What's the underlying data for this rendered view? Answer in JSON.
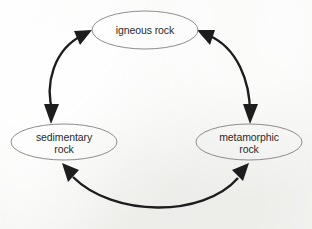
{
  "diagram": {
    "type": "cycle-diagram",
    "background_color": "#f2f2f0",
    "node_stroke_color": "#8d8d8d",
    "arrow_color": "#1d1d1d",
    "text_color": "#2b2b2b",
    "nodes": [
      {
        "id": "igneous",
        "label_line1": "igneous rock",
        "label_line2": "",
        "cx": 145,
        "cy": 30,
        "rx": 53,
        "ry": 19
      },
      {
        "id": "sedimentary",
        "label_line1": "sedimentary",
        "label_line2": "rock",
        "cx": 64,
        "cy": 142,
        "rx": 53,
        "ry": 18
      },
      {
        "id": "metamorphic",
        "label_line1": "metamorphic",
        "label_line2": "rock",
        "cx": 249,
        "cy": 142,
        "rx": 53,
        "ry": 18
      }
    ],
    "connectors": [
      {
        "id": "igneous-sedimentary",
        "from": "igneous",
        "to": "sedimentary",
        "style": "double-headed-curved-arrow",
        "bow": "outward-left"
      },
      {
        "id": "igneous-metamorphic",
        "from": "igneous",
        "to": "metamorphic",
        "style": "double-headed-curved-arrow",
        "bow": "outward-right"
      },
      {
        "id": "sedimentary-metamorphic",
        "from": "sedimentary",
        "to": "metamorphic",
        "style": "double-headed-curved-arrow",
        "bow": "outward-bottom"
      }
    ]
  }
}
